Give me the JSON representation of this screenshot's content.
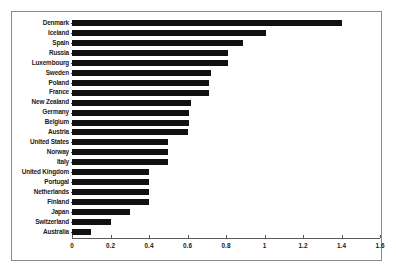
{
  "chart_data": {
    "type": "bar",
    "orientation": "horizontal",
    "title": "",
    "subtitle": "",
    "xlabel": "",
    "ylabel": "",
    "xlim": [
      0,
      1.6
    ],
    "ylim": null,
    "grid": false,
    "legend": null,
    "bar_color": "#111111",
    "frame_color": "#8a8a8a",
    "background": "#ffffff",
    "xticks": [
      "0",
      "0.2",
      "0.4",
      "0.6",
      "0.8",
      "1",
      "1.2",
      "1.4",
      "1.6"
    ],
    "xtick_values": [
      0,
      0.2,
      0.4,
      0.6,
      0.8,
      1.0,
      1.2,
      1.4,
      1.6
    ],
    "categories": [
      "Denmark",
      "Iceland",
      "Spain",
      "Russia",
      "Luxembourg",
      "Sweden",
      "Poland",
      "France",
      "New Zealand",
      "Germany",
      "Belgium",
      "Austria",
      "United States",
      "Norway",
      "Italy",
      "United Kingdom",
      "Portugal",
      "Netherlands",
      "Finland",
      "Japan",
      "Switzerland",
      "Australia"
    ],
    "values": [
      1.4,
      1.01,
      0.89,
      0.81,
      0.81,
      0.72,
      0.71,
      0.71,
      0.62,
      0.61,
      0.61,
      0.6,
      0.5,
      0.5,
      0.5,
      0.4,
      0.4,
      0.4,
      0.4,
      0.3,
      0.2,
      0.1
    ]
  }
}
